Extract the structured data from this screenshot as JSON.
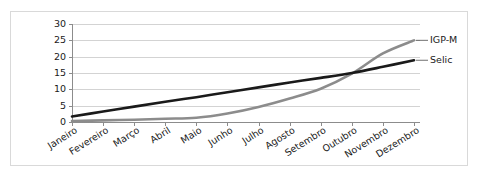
{
  "chart_data": {
    "type": "line",
    "title": "",
    "xlabel": "",
    "ylabel": "",
    "categories": [
      "Janeiro",
      "Fevereiro",
      "Março",
      "Abril",
      "Maio",
      "Junho",
      "Julho",
      "Agosto",
      "Setembro",
      "Outubro",
      "Novembro",
      "Dezembro"
    ],
    "yticks": [
      0,
      5,
      10,
      15,
      20,
      25,
      30
    ],
    "ylim": [
      0,
      30
    ],
    "grid": "horizontal",
    "legend_position": "right-inline",
    "series": [
      {
        "name": "IGP-M",
        "color": "#8c8c8c",
        "values": [
          0.3,
          0.5,
          0.7,
          1.0,
          1.3,
          2.6,
          4.6,
          7.2,
          10.2,
          14.8,
          21.0,
          25.0
        ]
      },
      {
        "name": "Selic",
        "color": "#1a1a1a",
        "values": [
          1.7,
          3.2,
          4.7,
          6.2,
          7.6,
          9.1,
          10.6,
          12.1,
          13.5,
          15.0,
          16.9,
          18.9
        ]
      }
    ],
    "colors": {
      "igpm": "#8c8c8c",
      "selic": "#1a1a1a",
      "grid": "#c8c8c8",
      "axis": "#8c8c8c",
      "frame": "#d9d9d9",
      "text": "#1a1a1a"
    }
  },
  "labels": {
    "igpm": "IGP-M",
    "selic": "Selic"
  }
}
